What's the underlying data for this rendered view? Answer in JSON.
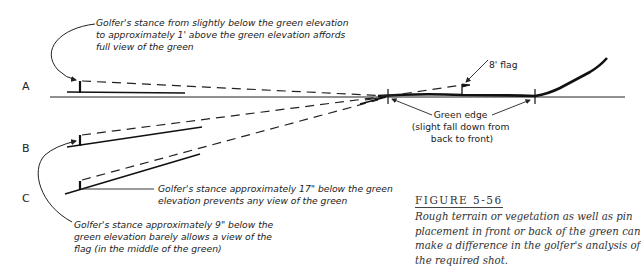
{
  "figure": {
    "title": "FIGURE 5-56",
    "caption_lines": [
      "Rough terrain or vegetation as well as pin",
      "placement in front or back of the green can",
      "make a difference in the golfer's analysis of",
      "the required shot."
    ]
  },
  "positions": {
    "a": "A",
    "b": "B",
    "c": "C"
  },
  "annotations": {
    "a_lines": [
      "Golfer's stance from slightly below the green elevation",
      "to approximately 1' above the green elevation affords",
      "full view of the green"
    ],
    "flag": "8' flag",
    "green_edge_lines": [
      "Green edge",
      "(slight fall down from",
      "back to front)"
    ],
    "c_lines": [
      "Golfer's stance approximately 17\" below the green",
      "elevation prevents any view of the green"
    ],
    "b_lines": [
      "Golfer's stance approximately 9\" below the",
      "green elevation barely allows a view of the",
      "flag (in the middle of the green)"
    ]
  }
}
